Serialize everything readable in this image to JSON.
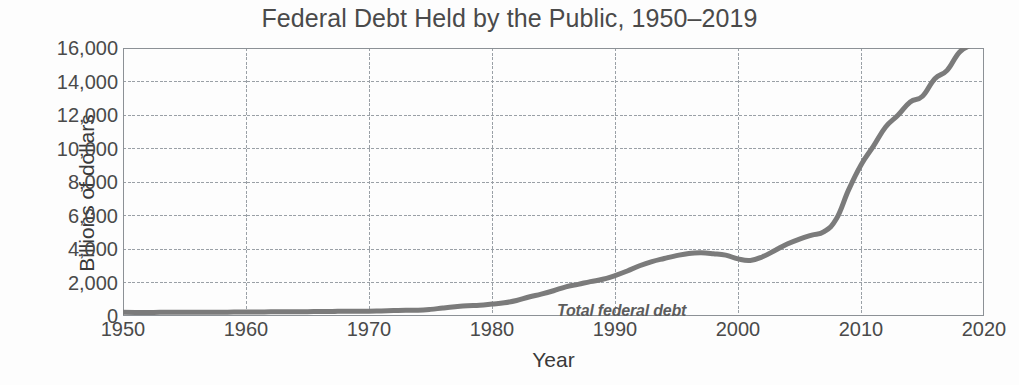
{
  "chart_data": {
    "type": "line",
    "title": "Federal Debt Held by the Public, 1950–2019",
    "xlabel": "Year",
    "ylabel": "Billions of dollars",
    "xlim": [
      1950,
      2020
    ],
    "ylim": [
      0,
      16000
    ],
    "grid": true,
    "legend_position": "inline-annotation",
    "annotations": [
      {
        "text": "Total federal debt",
        "x": 1981,
        "y": 2100,
        "style": "italic-bold"
      }
    ],
    "xticks": [
      1950,
      1960,
      1970,
      1980,
      1990,
      2000,
      2010,
      2020
    ],
    "xtick_labels": [
      "1950",
      "1960",
      "1970",
      "1980",
      "1990",
      "2000",
      "2010",
      "2020"
    ],
    "yticks": [
      0,
      2000,
      4000,
      6000,
      8000,
      10000,
      12000,
      14000,
      16000
    ],
    "ytick_labels": [
      "0",
      "2,000",
      "4,000",
      "6,000",
      "8,000",
      "10,000",
      "12,000",
      "14,000",
      "16,000"
    ],
    "series": [
      {
        "name": "Total federal debt",
        "color": "#7b7b7b",
        "line_width": 5,
        "x": [
          1950,
          1951,
          1952,
          1953,
          1954,
          1955,
          1956,
          1957,
          1958,
          1959,
          1960,
          1961,
          1962,
          1963,
          1964,
          1965,
          1966,
          1967,
          1968,
          1969,
          1970,
          1971,
          1972,
          1973,
          1974,
          1975,
          1976,
          1977,
          1978,
          1979,
          1980,
          1981,
          1982,
          1983,
          1984,
          1985,
          1986,
          1987,
          1988,
          1989,
          1990,
          1991,
          1992,
          1993,
          1994,
          1995,
          1996,
          1997,
          1998,
          1999,
          2000,
          2001,
          2002,
          2003,
          2004,
          2005,
          2006,
          2007,
          2008,
          2009,
          2010,
          2011,
          2012,
          2013,
          2014,
          2015,
          2016,
          2017,
          2018,
          2019
        ],
        "values": [
          219,
          214,
          214,
          218,
          224,
          226,
          222,
          219,
          226,
          235,
          237,
          238,
          248,
          254,
          257,
          261,
          264,
          267,
          290,
          278,
          283,
          303,
          322,
          341,
          344,
          395,
          477,
          549,
          607,
          640,
          712,
          789,
          925,
          1137,
          1307,
          1507,
          1741,
          1890,
          2052,
          2191,
          2412,
          2689,
          3000,
          3248,
          3433,
          3604,
          3734,
          3772,
          3721,
          3632,
          3410,
          3320,
          3540,
          3913,
          4296,
          4592,
          4829,
          5035,
          5803,
          7545,
          9019,
          10128,
          11281,
          11983,
          12780,
          13117,
          14168,
          14665,
          15750,
          16200
        ]
      }
    ]
  },
  "figure": {
    "background_color": "#fdfdfd",
    "grid_color": "#9aa0a6",
    "text_color": "#3a3a3a",
    "series_color": "#7b7b7b"
  }
}
